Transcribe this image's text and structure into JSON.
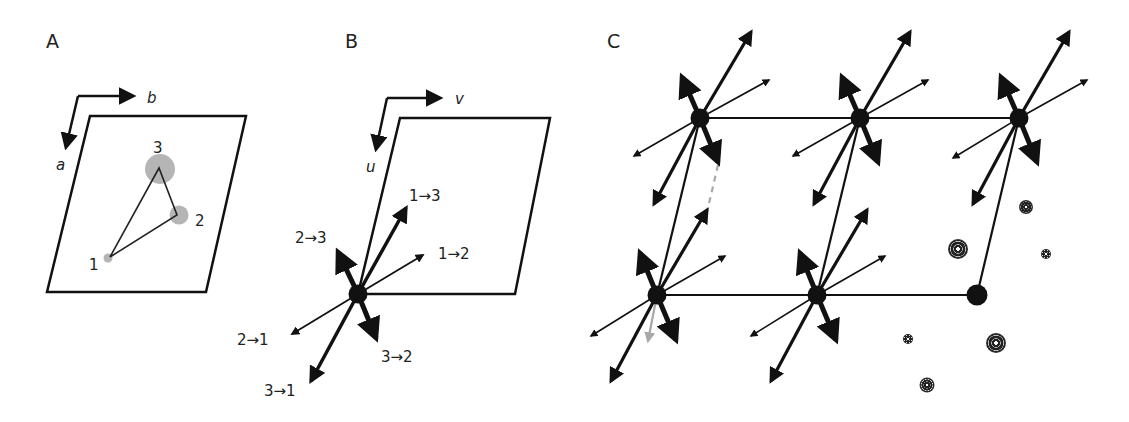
{
  "panels": {
    "a": {
      "label": "A",
      "axis_b": "b",
      "axis_a": "a",
      "sites": [
        {
          "id": "1",
          "label": "1"
        },
        {
          "id": "2",
          "label": "2"
        },
        {
          "id": "3",
          "label": "3"
        }
      ]
    },
    "b": {
      "label": "B",
      "axis_v": "v",
      "axis_u": "u",
      "vectors": [
        {
          "label": "1→3"
        },
        {
          "label": "1→2"
        },
        {
          "label": "2→3"
        },
        {
          "label": "2→1"
        },
        {
          "label": "3→2"
        },
        {
          "label": "3→1"
        }
      ]
    },
    "c": {
      "label": "C"
    }
  },
  "colors": {
    "ink": "#111111",
    "site_fill": "#b5b5b5",
    "dashed": "#a8a8a8",
    "gray_arrow": "#a8a8a8"
  }
}
